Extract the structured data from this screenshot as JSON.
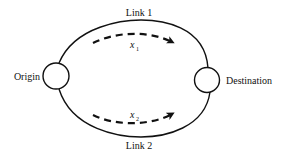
{
  "diagram": {
    "nodes": [
      {
        "id": "origin",
        "label": "Origin"
      },
      {
        "id": "destination",
        "label": "Destination"
      }
    ],
    "links": [
      {
        "id": "link1",
        "label": "Link 1",
        "flow_var": "x",
        "flow_sub": "1"
      },
      {
        "id": "link2",
        "label": "Link 2",
        "flow_var": "x",
        "flow_sub": "2"
      }
    ],
    "colors": {
      "stroke": "#111111",
      "background": "#ffffff"
    }
  }
}
